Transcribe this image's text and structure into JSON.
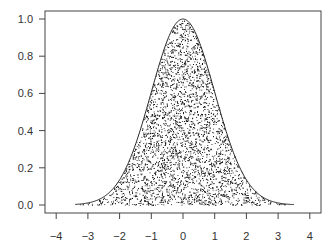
{
  "chart_data": {
    "type": "area",
    "title": "",
    "xlabel": "",
    "ylabel": "",
    "xlim": [
      -4.3,
      4.4
    ],
    "ylim": [
      -0.04,
      1.04
    ],
    "x_ticks": [
      -4,
      -3,
      -2,
      -1,
      0,
      1,
      2,
      3,
      4
    ],
    "x_tick_labels": [
      "−4",
      "−3",
      "−2",
      "−1",
      "0",
      "1",
      "2",
      "3",
      "4"
    ],
    "y_ticks": [
      0.0,
      0.2,
      0.4,
      0.6,
      0.8,
      1.0
    ],
    "y_tick_labels": [
      "0.0",
      "0.2",
      "0.4",
      "0.6",
      "0.8",
      "1.0"
    ],
    "curve": {
      "function": "exp(-x^2/2)",
      "x_range": [
        -3.4,
        3.5
      ],
      "x": [
        -3.4,
        -3,
        -2.5,
        -2,
        -1.5,
        -1,
        -0.5,
        0,
        0.5,
        1,
        1.5,
        2,
        2.5,
        3,
        3.5
      ],
      "y": [
        0.003,
        0.011,
        0.044,
        0.135,
        0.325,
        0.607,
        0.882,
        1.0,
        0.882,
        0.607,
        0.325,
        0.135,
        0.044,
        0.011,
        0.002
      ]
    },
    "points": {
      "count_approx": 4000,
      "style": "small black dots",
      "region": "under curve"
    },
    "grid": false,
    "legend": null
  },
  "colors": {
    "curve": "#222222",
    "points": "#111111",
    "axis": "#444444",
    "text": "#333333"
  }
}
